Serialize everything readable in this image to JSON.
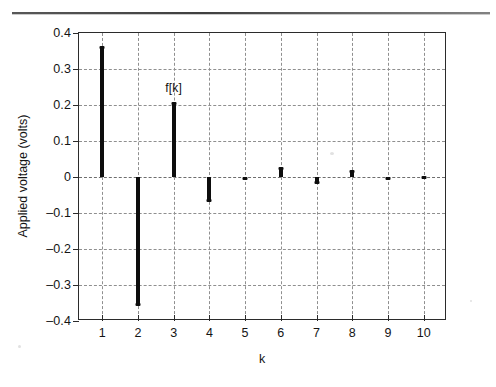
{
  "figure": {
    "kind": "stem-plot",
    "annotation_label": "f[k]"
  },
  "axes": {
    "y_title": "Applied voltage (volts)",
    "x_title": "k",
    "y_ticks": [
      "0.4",
      "0.3",
      "0.2",
      "0.1",
      "0",
      "-0.1",
      "-0.2",
      "-0.3",
      "-0.4"
    ],
    "x_ticks": [
      "1",
      "2",
      "3",
      "4",
      "5",
      "6",
      "7",
      "8",
      "9",
      "10"
    ]
  },
  "chart_data": {
    "type": "bar",
    "title": "",
    "subtitle": "",
    "xlabel": "k",
    "ylabel": "Applied voltage (volts)",
    "categories": [
      "1",
      "2",
      "3",
      "4",
      "5",
      "6",
      "7",
      "8",
      "9",
      "10"
    ],
    "values": [
      0.36,
      -0.355,
      0.205,
      -0.065,
      -0.005,
      0.025,
      -0.015,
      0.015,
      -0.005,
      0.0
    ],
    "series": [
      {
        "name": "f[k]",
        "values": [
          0.36,
          -0.355,
          0.205,
          -0.065,
          -0.005,
          0.025,
          -0.015,
          0.015,
          -0.005,
          0.0
        ]
      }
    ],
    "ylim": [
      -0.4,
      0.4
    ],
    "xlim": [
      0.35,
      10.65
    ],
    "ytick_step": 0.1,
    "grid": true,
    "grid_style": "dashed",
    "legend": "none",
    "annotations": [
      {
        "text": "f[k]",
        "x": 3.0,
        "y": 0.268
      }
    ],
    "series_color": "#0d0d0d"
  },
  "colors": {
    "stem": "#0d0d0d",
    "grid": "#8f8f8f",
    "axis": "#2b2b2b",
    "background": "#ffffff",
    "text": "#141414"
  }
}
